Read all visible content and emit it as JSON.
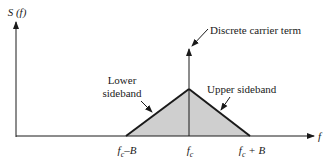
{
  "diagram": {
    "y_axis_label": "S (f)",
    "x_axis_label": "f",
    "annotations": {
      "carrier": "Discrete carrier term",
      "lower_sideband_line1": "Lower",
      "lower_sideband_line2": "sideband",
      "upper_sideband": "Upper sideband"
    },
    "ticks": {
      "left": {
        "base": "f",
        "sub": "c",
        "suffix": "–B"
      },
      "center": {
        "base": "f",
        "sub": "c",
        "suffix": ""
      },
      "right": {
        "base": "f",
        "sub": "c",
        "suffix": " + B"
      }
    },
    "colors": {
      "line": "#1a1a1a",
      "fill": "#cfcfcf"
    }
  }
}
